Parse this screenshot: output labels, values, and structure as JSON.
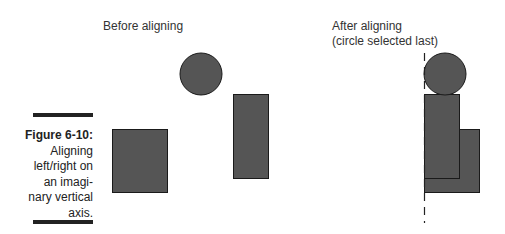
{
  "labels": {
    "before": "Before aligning",
    "after_line1": "After aligning",
    "after_line2": "(circle selected last)"
  },
  "caption": {
    "figure": "Figure 6-10:",
    "line1": "Aligning",
    "line2": "left/right on",
    "line3": "an imagi-",
    "line4": "nary vertical",
    "line5": "axis."
  },
  "colors": {
    "shape_fill": "#555555",
    "shape_stroke": "#1a1a1a",
    "rule": "#222222"
  }
}
